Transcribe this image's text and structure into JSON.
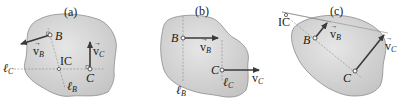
{
  "figure": {
    "panels": [
      {
        "caption": "(a)",
        "points": {
          "B": "B",
          "C": "C",
          "IC": "IC"
        },
        "vectors": {
          "vB": {
            "main": "v",
            "sub": "B"
          },
          "vC": {
            "main": "v",
            "sub": "C"
          }
        },
        "lines": {
          "lC": {
            "main": "ℓ",
            "sub": "C"
          },
          "lB": {
            "main": "ℓ",
            "sub": "B"
          }
        }
      },
      {
        "caption": "(b)",
        "points": {
          "B": "B",
          "C": "C"
        },
        "vectors": {
          "vB": {
            "main": "v",
            "sub": "B"
          },
          "vC": {
            "main": "v",
            "sub": "C"
          }
        },
        "lines": {
          "lB": {
            "main": "ℓ",
            "sub": "B"
          },
          "lC": {
            "main": "ℓ",
            "sub": "C"
          }
        }
      },
      {
        "caption": "(c)",
        "points": {
          "B": "B",
          "C": "C",
          "IC": "IC"
        },
        "vectors": {
          "vB": {
            "main": "v",
            "sub": "B"
          },
          "vC": {
            "main": "v",
            "sub": "C"
          }
        }
      }
    ],
    "colors": {
      "body_fill": "#d4d4d4",
      "body_stroke": "#8c8c8c",
      "vector": "#3a3a3a",
      "dashed_line": "#8a8a8a",
      "text": "#1a1a1a"
    }
  }
}
